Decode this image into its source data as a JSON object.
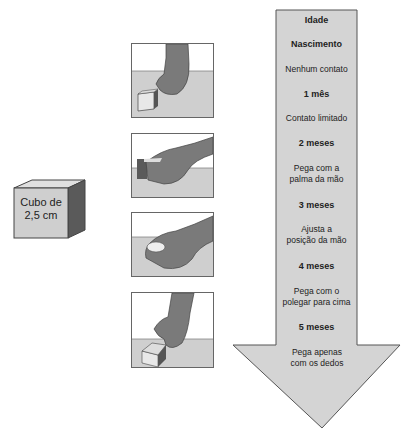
{
  "cube": {
    "label_line1": "Cubo de",
    "label_line2": "2,5 cm"
  },
  "panels": [
    {
      "stage": "Contato limitado"
    },
    {
      "stage": "Pega com a palma da mão"
    },
    {
      "stage": "Ajusta a posição da mão"
    },
    {
      "stage": "Pega apenas com os dedos"
    }
  ],
  "arrow": {
    "header": "Idade",
    "items": [
      {
        "age": "Nascimento",
        "desc": "Nenhum contato"
      },
      {
        "age": "1 mês",
        "desc": "Contato limitado"
      },
      {
        "age": "2 meses",
        "desc_line1": "Pega com a",
        "desc_line2": "palma da mão"
      },
      {
        "age": "3 meses",
        "desc_line1": "Ajusta a",
        "desc_line2": "posição da mão"
      },
      {
        "age": "4 meses",
        "desc_line1": "Pega com o",
        "desc_line2": "polegar para cima"
      },
      {
        "age": "5 meses",
        "desc_line1": "Pega apenas",
        "desc_line2": "com os dedos"
      }
    ]
  },
  "colors": {
    "arrow_fill": "#d4d4d4",
    "table": "#cfcfcf",
    "hand": "#7a7a7a",
    "cube_front": "#cfcfcf",
    "cube_side": "#5a5a5a"
  }
}
